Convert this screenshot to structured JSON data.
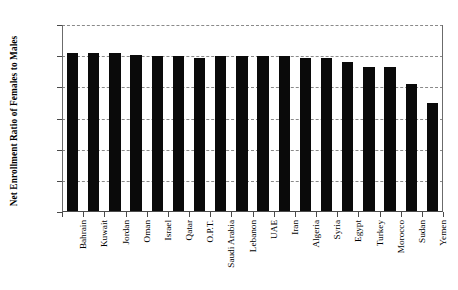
{
  "chart_data": {
    "type": "bar",
    "title": "",
    "subtitle": "",
    "xlabel": "",
    "ylabel": "Net Enrollment Ratio of Females to Males",
    "ylim": [
      0.0,
      1.2
    ],
    "ytick_labels": [
      "0.00",
      "0.20",
      "0.40",
      "0.60",
      "0.80",
      "1.00",
      "1.20"
    ],
    "ytick_values": [
      0.0,
      0.2,
      0.4,
      0.6,
      0.8,
      1.0,
      1.2
    ],
    "grid": "horizontal-dashed",
    "legend": "none",
    "bar_color": "#0a0a0a",
    "categories": [
      "Bahrain",
      "Kuwait",
      "Jordan",
      "Oman",
      "Israel",
      "Qatar",
      "O.P.T.",
      "Saudi Arabia",
      "Lebanon",
      "UAE",
      "Iran",
      "Algeria",
      "Syria",
      "Egypt",
      "Turkey",
      "Morocco",
      "Sudan",
      "Yemen"
    ],
    "values": [
      1.02,
      1.02,
      1.02,
      1.01,
      1.0,
      1.0,
      0.99,
      1.0,
      1.0,
      1.0,
      1.0,
      0.99,
      0.99,
      0.96,
      0.93,
      0.93,
      0.82,
      0.7
    ]
  }
}
